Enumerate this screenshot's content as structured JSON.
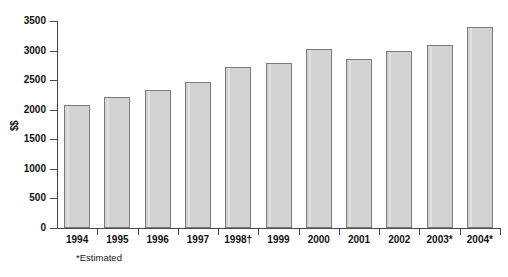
{
  "chart_data": {
    "type": "bar",
    "title": "",
    "subtitle": "",
    "xlabel": "",
    "ylabel": "$$",
    "categories": [
      "1994",
      "1995",
      "1996",
      "1997",
      "1998†",
      "1999",
      "2000",
      "2001",
      "2002",
      "2003*",
      "2004*"
    ],
    "values": [
      2080,
      2215,
      2335,
      2470,
      2715,
      2785,
      3030,
      2860,
      2990,
      3100,
      3395
    ],
    "series": [
      {
        "name": "$$",
        "values": [
          2080,
          2215,
          2335,
          2470,
          2715,
          2785,
          3030,
          2860,
          2990,
          3100,
          3395
        ]
      }
    ],
    "ylim": [
      0,
      3500
    ],
    "ytick_labels": [
      "0",
      "500",
      "1000",
      "1500",
      "2000",
      "2500",
      "3000",
      "3500"
    ],
    "ytick_values": [
      0,
      500,
      1000,
      1500,
      2000,
      2500,
      3000,
      3500
    ],
    "grid": false,
    "legend": false,
    "legend_position": "none",
    "annotations": [
      "*Estimated"
    ],
    "bar_fill_color": "#d2d2d2",
    "bar_border_color": "#7b7b7b",
    "axis_color": "#4a4a4a",
    "background_color": "#ffffff"
  },
  "footnote": {
    "text": "*Estimated"
  }
}
